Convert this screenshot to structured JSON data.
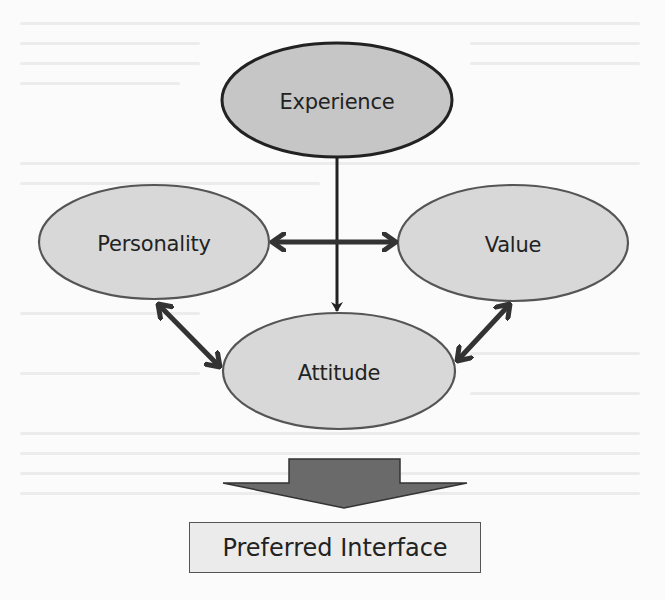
{
  "diagram": {
    "nodes": [
      {
        "id": "experience",
        "label": "Experience",
        "cx": 337,
        "cy": 100,
        "rx": 115,
        "ry": 57,
        "fill": "#c6c6c6",
        "stroke": "#222222"
      },
      {
        "id": "personality",
        "label": "Personality",
        "cx": 154,
        "cy": 242,
        "rx": 115,
        "ry": 57,
        "fill": "#d8d8d8",
        "stroke": "#555555"
      },
      {
        "id": "value",
        "label": "Value",
        "cx": 513,
        "cy": 243,
        "rx": 115,
        "ry": 58,
        "fill": "#d8d8d8",
        "stroke": "#555555"
      },
      {
        "id": "attitude",
        "label": "Attitude",
        "cx": 339,
        "cy": 371,
        "rx": 116,
        "ry": 58,
        "fill": "#d8d8d8",
        "stroke": "#555555"
      }
    ],
    "edges": [
      {
        "from": "experience",
        "to": "attitude",
        "type": "directed"
      },
      {
        "from": "personality",
        "to": "value",
        "type": "bidirectional"
      },
      {
        "from": "personality",
        "to": "attitude",
        "type": "bidirectional"
      },
      {
        "from": "value",
        "to": "attitude",
        "type": "bidirectional"
      }
    ],
    "output_arrow": {
      "color": "#6a6a6a"
    },
    "result": {
      "label": "Preferred Interface"
    }
  }
}
